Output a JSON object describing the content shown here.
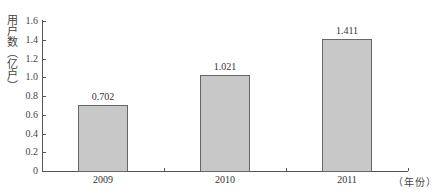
{
  "chart_data": {
    "type": "bar",
    "title": "",
    "xlabel": "（年份）",
    "ylabel": "用户数（亿户）",
    "categories": [
      "2009",
      "2010",
      "2011"
    ],
    "values": [
      0.702,
      1.021,
      1.411
    ],
    "data_labels": [
      "0.702",
      "1.021",
      "1.411"
    ],
    "ylim": [
      0,
      1.6
    ],
    "yticks": [
      "0",
      "0.2",
      "0.4",
      "0.6",
      "0.8",
      "1.0",
      "1.2",
      "1.4",
      "1.6"
    ],
    "grid": false,
    "legend": null,
    "bar_color": "#c8c8c8",
    "bar_border_color": "#666666"
  }
}
